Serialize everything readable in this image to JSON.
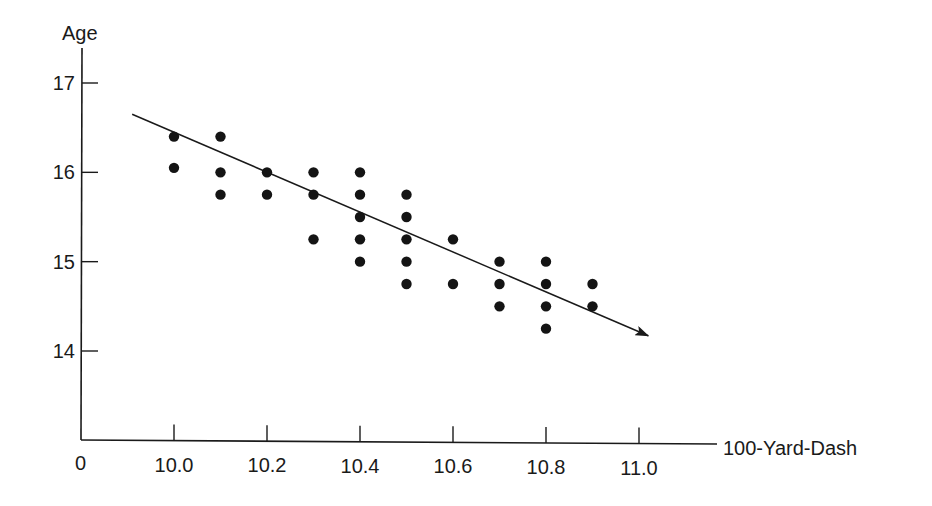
{
  "chart_data": {
    "type": "scatter",
    "title": "",
    "xlabel": "100-Yard-Dash",
    "ylabel": "Age",
    "origin_label": "0",
    "x_ticks": [
      10.0,
      10.2,
      10.4,
      10.6,
      10.8,
      11.0
    ],
    "x_tick_labels": [
      "10.0",
      "10.2",
      "10.4",
      "10.6",
      "10.8",
      "11.0"
    ],
    "y_ticks": [
      14,
      15,
      16,
      17
    ],
    "y_tick_labels": [
      "14",
      "15",
      "16",
      "17"
    ],
    "xlim": [
      9.8,
      11.17
    ],
    "ylim": [
      13.0,
      17.4
    ],
    "axis_break": true,
    "grid": false,
    "legend": null,
    "points": [
      {
        "x": 10.0,
        "y": 16.4
      },
      {
        "x": 10.0,
        "y": 16.05
      },
      {
        "x": 10.1,
        "y": 16.4
      },
      {
        "x": 10.1,
        "y": 16.0
      },
      {
        "x": 10.1,
        "y": 15.75
      },
      {
        "x": 10.2,
        "y": 16.0
      },
      {
        "x": 10.2,
        "y": 15.75
      },
      {
        "x": 10.3,
        "y": 16.0
      },
      {
        "x": 10.3,
        "y": 15.75
      },
      {
        "x": 10.3,
        "y": 15.25
      },
      {
        "x": 10.4,
        "y": 16.0
      },
      {
        "x": 10.4,
        "y": 15.75
      },
      {
        "x": 10.4,
        "y": 15.5
      },
      {
        "x": 10.4,
        "y": 15.25
      },
      {
        "x": 10.4,
        "y": 15.0
      },
      {
        "x": 10.5,
        "y": 15.75
      },
      {
        "x": 10.5,
        "y": 15.5
      },
      {
        "x": 10.5,
        "y": 15.25
      },
      {
        "x": 10.5,
        "y": 15.0
      },
      {
        "x": 10.5,
        "y": 14.75
      },
      {
        "x": 10.6,
        "y": 15.25
      },
      {
        "x": 10.6,
        "y": 14.75
      },
      {
        "x": 10.7,
        "y": 15.0
      },
      {
        "x": 10.7,
        "y": 14.75
      },
      {
        "x": 10.7,
        "y": 14.5
      },
      {
        "x": 10.8,
        "y": 15.0
      },
      {
        "x": 10.8,
        "y": 14.75
      },
      {
        "x": 10.8,
        "y": 14.5
      },
      {
        "x": 10.8,
        "y": 14.25
      },
      {
        "x": 10.9,
        "y": 14.75
      },
      {
        "x": 10.9,
        "y": 14.5
      }
    ],
    "trend_line": {
      "type": "arrow",
      "start": {
        "x": 9.91,
        "y": 16.65
      },
      "end": {
        "x": 11.02,
        "y": 14.17
      }
    }
  },
  "colors": {
    "ink": "#1a1a1a",
    "dot": "#141414",
    "background": "#ffffff"
  }
}
